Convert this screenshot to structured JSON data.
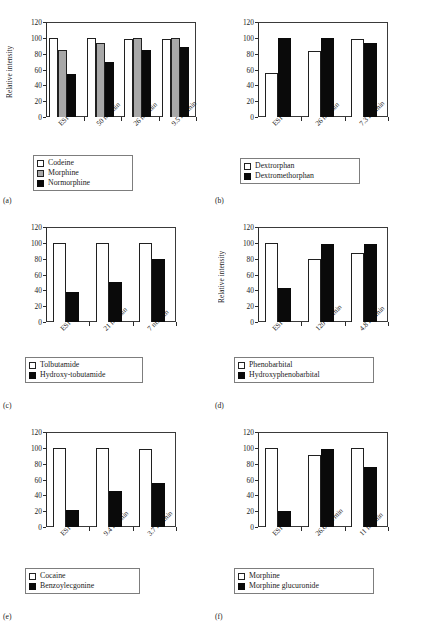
{
  "figure": {
    "axis_title": "Relative intensity",
    "yticks": [
      "0",
      "20",
      "40",
      "60",
      "80",
      "100",
      "120"
    ],
    "colors": {
      "series_white": "#ffffff",
      "series_gray": "#a8a8a8",
      "series_black": "#0a0a0a",
      "axis": "#2b2b2b"
    }
  },
  "panels": [
    {
      "caption": "(a)",
      "ylabel": "Relative intensity",
      "show_ylabel": true,
      "chart_data": {
        "type": "bar",
        "title": "",
        "xlabel": "",
        "ylabel": "Relative intensity",
        "ylim": [
          0,
          120
        ],
        "yticks": [
          0,
          20,
          40,
          60,
          80,
          100,
          120
        ],
        "grid": false,
        "legend_position": "below",
        "categories": [
          "ESI",
          "50 nL/min",
          "26 nL/min",
          "9.5 nL/min"
        ],
        "series": [
          {
            "name": "Codeine",
            "fill": "white",
            "values": [
              100,
              100,
              98,
              98
            ]
          },
          {
            "name": "Morphine",
            "fill": "gray",
            "values": [
              85,
              94,
              100,
              100
            ]
          },
          {
            "name": "Normorphine",
            "fill": "black",
            "values": [
              54,
              70,
              85,
              89
            ]
          }
        ]
      }
    },
    {
      "caption": "(b)",
      "ylabel": "",
      "show_ylabel": false,
      "chart_data": {
        "type": "bar",
        "title": "",
        "xlabel": "",
        "ylabel": "",
        "ylim": [
          0,
          120
        ],
        "yticks": [
          0,
          20,
          40,
          60,
          80,
          100,
          120
        ],
        "grid": false,
        "legend_position": "below",
        "categories": [
          "ESI",
          "26 nL/min",
          "7.3 nL/min"
        ],
        "series": [
          {
            "name": "Dextrorphan",
            "fill": "white",
            "values": [
              55,
              84,
              99
            ]
          },
          {
            "name": "Dextromethorphan",
            "fill": "black",
            "values": [
              100,
              100,
              93
            ]
          }
        ]
      }
    },
    {
      "caption": "(c)",
      "ylabel": "",
      "show_ylabel": false,
      "chart_data": {
        "type": "bar",
        "title": "",
        "xlabel": "",
        "ylabel": "",
        "ylim": [
          0,
          120
        ],
        "yticks": [
          0,
          20,
          40,
          60,
          80,
          100,
          120
        ],
        "grid": false,
        "legend_position": "below",
        "categories": [
          "ESI",
          "21 nL/min",
          "7 nL/min"
        ],
        "series": [
          {
            "name": "Tolbutamide",
            "fill": "white",
            "values": [
              100,
              100,
              100
            ]
          },
          {
            "name": "Hydroxy-tobutamide",
            "fill": "black",
            "values": [
              38,
              51,
              80
            ]
          }
        ]
      }
    },
    {
      "caption": "(d)",
      "ylabel": "Relative intensity",
      "show_ylabel": true,
      "chart_data": {
        "type": "bar",
        "title": "",
        "xlabel": "",
        "ylabel": "Relative intensity",
        "ylim": [
          0,
          120
        ],
        "yticks": [
          0,
          20,
          40,
          60,
          80,
          100,
          120
        ],
        "grid": false,
        "legend_position": "below",
        "categories": [
          "ESI",
          "120 nL/min",
          "4.8 nL/min"
        ],
        "series": [
          {
            "name": "Phenobarbital",
            "fill": "white",
            "values": [
              100,
              79,
              87
            ]
          },
          {
            "name": "Hydroxyphenobarbital",
            "fill": "black",
            "values": [
              43,
              99,
              99
            ]
          }
        ]
      }
    },
    {
      "caption": "(e)",
      "ylabel": "",
      "show_ylabel": false,
      "chart_data": {
        "type": "bar",
        "title": "",
        "xlabel": "",
        "ylabel": "",
        "ylim": [
          0,
          120
        ],
        "yticks": [
          0,
          20,
          40,
          60,
          80,
          100,
          120
        ],
        "grid": false,
        "legend_position": "below",
        "categories": [
          "ESI",
          "9.4 nL/min",
          "3.7 nL/min"
        ],
        "series": [
          {
            "name": "Cocaine",
            "fill": "white",
            "values": [
              100,
              100,
              99
            ]
          },
          {
            "name": "Benzoylecgonine",
            "fill": "black",
            "values": [
              22,
              45,
              55
            ]
          }
        ]
      }
    },
    {
      "caption": "(f)",
      "ylabel": "",
      "show_ylabel": false,
      "chart_data": {
        "type": "bar",
        "title": "",
        "xlabel": "",
        "ylabel": "",
        "ylim": [
          0,
          120
        ],
        "yticks": [
          0,
          20,
          40,
          60,
          80,
          100,
          120
        ],
        "grid": false,
        "legend_position": "below",
        "categories": [
          "ESI",
          "26.6 nL/min",
          "11 nL/min"
        ],
        "series": [
          {
            "name": "Morphine",
            "fill": "white",
            "values": [
              100,
              91,
              100
            ]
          },
          {
            "name": "Morphine glucuronide",
            "fill": "black",
            "values": [
              20,
              98,
              76
            ]
          }
        ]
      }
    }
  ]
}
